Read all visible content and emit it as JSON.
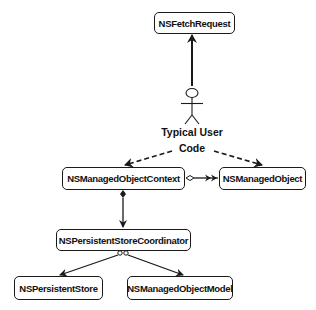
{
  "diagram": {
    "type": "uml-class-relationship",
    "actor": {
      "label_line1": "Typical User",
      "label_line2": "Code",
      "icon": "stick-figure-icon"
    },
    "nodes": [
      {
        "id": "fetch_request",
        "label": "NSFetchRequest"
      },
      {
        "id": "context",
        "label": "NSManagedObjectContext"
      },
      {
        "id": "managed_object",
        "label": "NSManagedObject"
      },
      {
        "id": "coordinator",
        "label": "NSPersistentStoreCoordinator"
      },
      {
        "id": "persistent_store",
        "label": "NSPersistentStore"
      },
      {
        "id": "object_model",
        "label": "NSManagedObjectModel"
      }
    ],
    "edges": [
      {
        "from": "actor",
        "to": "fetch_request",
        "style": "solid",
        "head": "filled-arrow"
      },
      {
        "from": "actor",
        "to": "context",
        "style": "dashed",
        "head": "filled-arrow"
      },
      {
        "from": "actor",
        "to": "managed_object",
        "style": "dashed",
        "head": "filled-arrow"
      },
      {
        "from": "context",
        "to": "managed_object",
        "style": "solid",
        "tail": "open-diamond",
        "head": "double-arrow"
      },
      {
        "from": "context",
        "to": "coordinator",
        "style": "solid",
        "tail": "filled-diamond",
        "head": "arrow"
      },
      {
        "from": "coordinator",
        "to": "persistent_store",
        "style": "solid",
        "tail": "open-diamond",
        "head": "arrow"
      },
      {
        "from": "coordinator",
        "to": "object_model",
        "style": "solid",
        "tail": "open-diamond",
        "head": "arrow"
      }
    ],
    "colors": {
      "stroke": "#1a1a1a",
      "background": "#ffffff",
      "text": "#111111"
    }
  }
}
